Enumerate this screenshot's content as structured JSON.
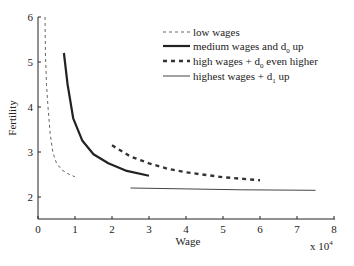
{
  "chart_data": {
    "type": "line",
    "title": "",
    "xlabel": "Wage",
    "ylabel": "Fertility",
    "x_multiplier": "x 10",
    "x_multiplier_exp": "4",
    "xlim": [
      0,
      8
    ],
    "ylim": [
      1.5,
      6
    ],
    "xticks": [
      "0",
      "1",
      "2",
      "3",
      "4",
      "5",
      "6",
      "7",
      "8"
    ],
    "yticks": [
      "2",
      "3",
      "4",
      "5",
      "6"
    ],
    "grid": false,
    "legend_position": "upper right",
    "series": [
      {
        "name": "low wages",
        "sub": "",
        "suffix": "",
        "style": "dashed-thin",
        "points": [
          [
            0.19,
            6.0
          ],
          [
            0.2,
            5.2
          ],
          [
            0.23,
            4.5
          ],
          [
            0.27,
            4.0
          ],
          [
            0.33,
            3.4
          ],
          [
            0.4,
            3.0
          ],
          [
            0.5,
            2.75
          ],
          [
            0.65,
            2.6
          ],
          [
            0.8,
            2.52
          ],
          [
            1.0,
            2.45
          ]
        ]
      },
      {
        "name": "medium wages and d",
        "sub": "0",
        "suffix": " up",
        "style": "solid-thick",
        "points": [
          [
            0.7,
            5.2
          ],
          [
            0.8,
            4.5
          ],
          [
            0.95,
            3.75
          ],
          [
            1.2,
            3.25
          ],
          [
            1.5,
            2.95
          ],
          [
            1.9,
            2.75
          ],
          [
            2.4,
            2.58
          ],
          [
            3.0,
            2.47
          ]
        ]
      },
      {
        "name": "high wages + d",
        "sub": "0",
        "suffix": " even higher",
        "style": "dashed-thick",
        "points": [
          [
            2.0,
            3.15
          ],
          [
            2.5,
            2.9
          ],
          [
            3.0,
            2.75
          ],
          [
            3.5,
            2.63
          ],
          [
            4.0,
            2.55
          ],
          [
            5.0,
            2.44
          ],
          [
            6.0,
            2.37
          ]
        ]
      },
      {
        "name": "highest wages + d",
        "sub": "1",
        "suffix": " up",
        "style": "solid-thin",
        "points": [
          [
            2.5,
            2.2
          ],
          [
            4.0,
            2.18
          ],
          [
            5.5,
            2.16
          ],
          [
            7.5,
            2.15
          ]
        ]
      }
    ]
  }
}
